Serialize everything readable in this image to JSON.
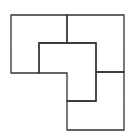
{
  "diagram": {
    "title": "",
    "stroke_color": "#333333",
    "background": "#ffffff",
    "stroke_width": 1.3,
    "pieces": [
      {
        "name": "top-left-square",
        "points": "11,15 67,15 67,43 39,43 39,73 11,73"
      },
      {
        "name": "top-right-square",
        "points": "67,15 124,15 124,72 96,72 96,43 67,43"
      },
      {
        "name": "bottom-right-square",
        "points": "96,72 124,72 124,130 67,130 67,101 96,101"
      },
      {
        "name": "center-l-piece",
        "points": "39,43 96,43 96,101 67,101 67,73 39,73"
      }
    ]
  }
}
